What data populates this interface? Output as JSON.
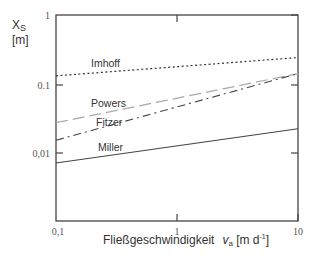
{
  "chart_data": {
    "type": "line",
    "title": "",
    "xlabel": "Fließgeschwindigkeit",
    "xlabel_var": "v",
    "xlabel_sub": "a",
    "xlabel_unit_open": " [m d",
    "xlabel_unit_sup": "-1",
    "xlabel_unit_close": "]",
    "ylabel": "X",
    "ylabel_sub": "S",
    "ylabel_unit": "[m]",
    "xscale": "log",
    "yscale": "log",
    "xlim": [
      0.1,
      10
    ],
    "ylim": [
      0.001,
      1
    ],
    "x_ticks": [
      "0,1",
      "1",
      "10"
    ],
    "y_ticks": [
      "1",
      "0.1",
      "0,01"
    ],
    "grid": false,
    "legend": "inline labels",
    "x": [
      0.1,
      10
    ],
    "series": [
      {
        "name": "Imhoff",
        "style": "dotted",
        "values": [
          0.13,
          0.24
        ]
      },
      {
        "name": "Powers",
        "style": "long-dash",
        "values": [
          0.027,
          0.14
        ]
      },
      {
        "name": "Fitzer",
        "style": "dash-dot",
        "values": [
          0.015,
          0.14
        ]
      },
      {
        "name": "Miller",
        "style": "solid",
        "values": [
          0.007,
          0.022
        ]
      }
    ]
  }
}
